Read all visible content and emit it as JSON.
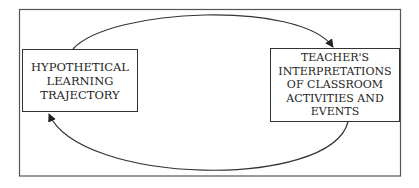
{
  "diagram": {
    "type": "cycle",
    "nodes": [
      {
        "id": "hlt",
        "lines": [
          "HYPOTHETICAL",
          "LEARNING",
          "TRAJECTORY"
        ]
      },
      {
        "id": "tic",
        "lines": [
          "TEACHER'S",
          "INTERPRETATIONS",
          "OF CLASSROOM",
          "ACTIVITIES AND",
          "EVENTS"
        ]
      }
    ],
    "edges": [
      {
        "from": "hlt",
        "to": "tic",
        "path": "top-arc"
      },
      {
        "from": "tic",
        "to": "hlt",
        "path": "bottom-arc"
      }
    ],
    "colors": {
      "stroke": "#333333",
      "text": "#1e1e1e",
      "background": "#ffffff"
    }
  }
}
